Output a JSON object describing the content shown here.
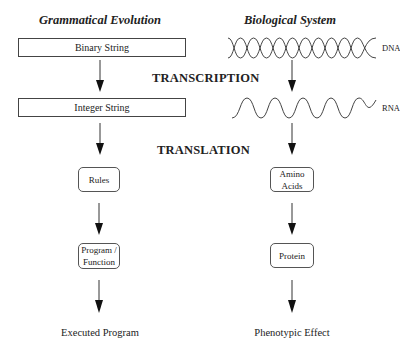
{
  "left_column": {
    "title": "Grammatical Evolution",
    "binary_string": "Binary String",
    "integer_string": "Integer String",
    "rules": "Rules",
    "program_line1": "Program /",
    "program_line2": "Function",
    "output": "Executed Program"
  },
  "right_column": {
    "title": "Biological System",
    "dna_label": "DNA",
    "rna_label": "RNA",
    "amino_line1": "Amino",
    "amino_line2": "Acids",
    "protein": "Protein",
    "output": "Phenotypic Effect"
  },
  "stages": {
    "transcription": "TRANSCRIPTION",
    "translation": "TRANSLATION"
  }
}
